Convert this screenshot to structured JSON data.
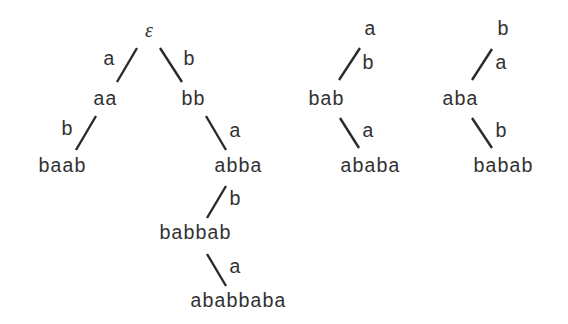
{
  "diagram": {
    "type": "trie-trees",
    "trees": [
      {
        "root": "ε",
        "nodes": {
          "root": "ε",
          "aa": "aa",
          "bb": "bb",
          "baab": "baab",
          "abba": "abba",
          "babbab": "babbab",
          "ababbaba": "ababbaba"
        },
        "edge_labels": {
          "root_aa": "a",
          "root_bb": "b",
          "aa_baab": "b",
          "bb_abba": "a",
          "abba_babbab": "b",
          "babbab_ababbaba": "a"
        }
      },
      {
        "root": "a",
        "nodes": {
          "root": "a",
          "bab": "bab",
          "ababa": "ababa"
        },
        "edge_labels": {
          "root_bab": "b",
          "bab_ababa": "a"
        }
      },
      {
        "root": "b",
        "nodes": {
          "root": "b",
          "aba": "aba",
          "babab": "babab"
        },
        "edge_labels": {
          "root_aba": "a",
          "aba_babab": "b"
        }
      }
    ]
  }
}
